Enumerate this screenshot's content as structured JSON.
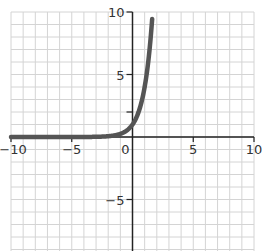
{
  "chart_data": {
    "type": "line",
    "title": "",
    "xlabel": "",
    "ylabel": "",
    "xlim": [
      -10,
      10
    ],
    "ylim": [
      -9,
      10
    ],
    "grid": true,
    "grid_step": 1,
    "x_ticks": [
      -10,
      -5,
      0,
      5,
      10
    ],
    "x_tick_labels": [
      "−10",
      "−5",
      "0",
      "5",
      "10"
    ],
    "y_ticks": [
      -5,
      2,
      5,
      10
    ],
    "y_tick_labels": [
      "−5",
      "",
      "5",
      "10"
    ],
    "series": [
      {
        "name": "y = 4^x",
        "function": "4^x",
        "x_range": [
          -10,
          1.62
        ],
        "x": [
          -10,
          -5,
          -3,
          -2,
          -1,
          -0.5,
          0,
          0.5,
          1,
          1.25,
          1.5,
          1.62
        ],
        "y": [
          1e-06,
          0.001,
          0.016,
          0.0625,
          0.25,
          0.5,
          1,
          2,
          4,
          5.66,
          8,
          9.45
        ],
        "color": "#555555"
      }
    ],
    "legend": null
  },
  "colors": {
    "grid": "#d4d4d4",
    "axis": "#222222",
    "curve": "#555555"
  }
}
